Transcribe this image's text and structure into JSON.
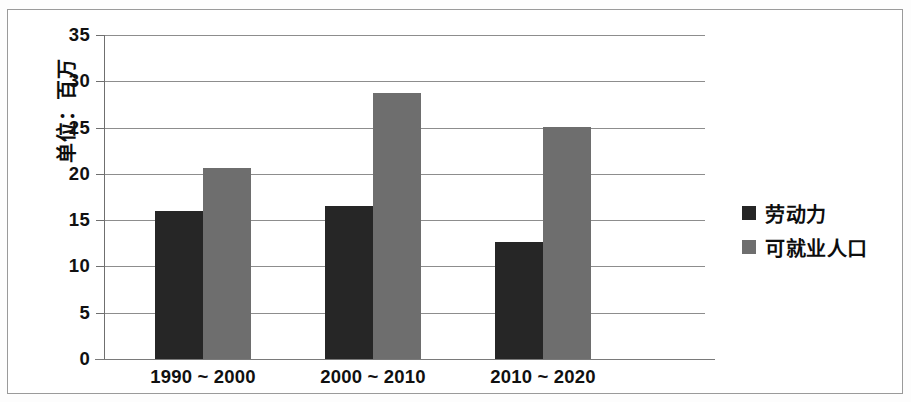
{
  "chart_data": {
    "type": "bar",
    "title": "",
    "subtitle": "",
    "xlabel": "",
    "ylabel": "单位：百万",
    "categories": [
      "1990 ~ 2000",
      "2000 ~ 2010",
      "2010 ~ 2020"
    ],
    "series": [
      {
        "name": "劳动力",
        "color": "#262626",
        "values": [
          16.0,
          16.5,
          12.6
        ]
      },
      {
        "name": "可就业人口",
        "color": "#6e6e6e",
        "values": [
          20.6,
          28.7,
          25.1
        ]
      }
    ],
    "ylim": [
      0,
      35
    ],
    "ytick_values": [
      0,
      5,
      10,
      15,
      20,
      25,
      30,
      35
    ],
    "ytick_labels": [
      "0",
      "5",
      "10",
      "15",
      "20",
      "25",
      "30",
      "35"
    ],
    "grid": true,
    "grid_axis": "y",
    "legend_position": "right"
  },
  "axes": {
    "y_title": "单位：百万"
  },
  "legend": {
    "entries": [
      {
        "label": "劳动力"
      },
      {
        "label": "可就业人口"
      }
    ]
  }
}
